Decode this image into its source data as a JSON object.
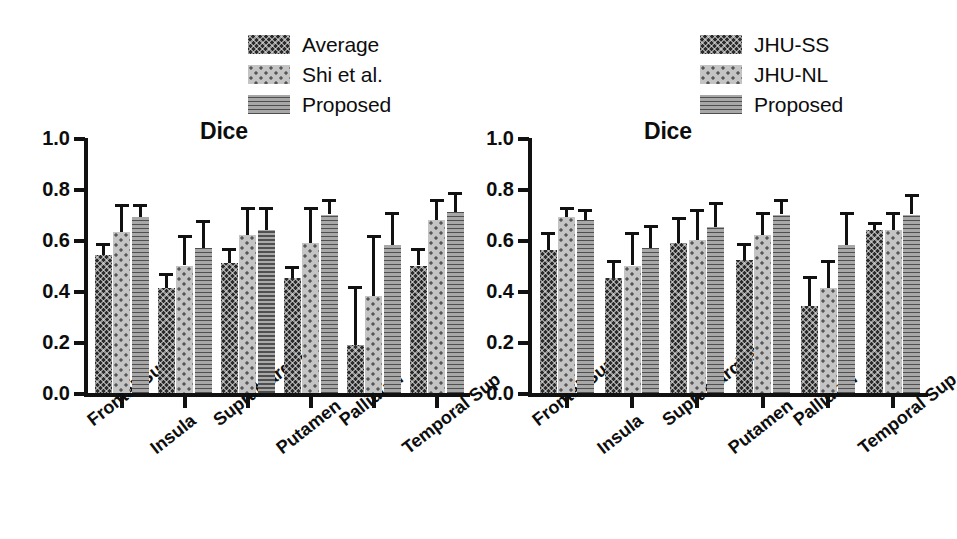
{
  "figure": {
    "panel_count": 2,
    "background": "#ffffff"
  },
  "panels": [
    {
      "id": "left-panel",
      "title": "Dice",
      "legend": [
        {
          "label": "Average",
          "pattern": "dark-crosshatch",
          "color": "#2b2b2b"
        },
        {
          "label": "Shi et al.",
          "pattern": "light-dots",
          "color": "#c4c4c4"
        },
        {
          "label": "Proposed",
          "pattern": "mid-hlines",
          "color": "#a8a8a8"
        }
      ],
      "chart_data": {
        "type": "bar",
        "title": "Dice",
        "xlabel": "",
        "ylabel": "",
        "ylim": [
          0.0,
          1.0
        ],
        "yticks": [
          "0.0",
          "0.2",
          "0.4",
          "0.6",
          "0.8",
          "1.0"
        ],
        "grid": false,
        "legend_position": "top-right",
        "categories": [
          "Frontal Sup",
          "Insula",
          "SupraMarginal",
          "Putamen",
          "Pallidum",
          "Temporal Sup"
        ],
        "series": [
          {
            "name": "Average",
            "values": [
              0.54,
              0.41,
              0.51,
              0.45,
              0.19,
              0.5
            ],
            "errors": [
              0.05,
              0.06,
              0.06,
              0.05,
              0.23,
              0.07
            ]
          },
          {
            "name": "Shi et al.",
            "values": [
              0.63,
              0.5,
              0.62,
              0.59,
              0.38,
              0.68
            ],
            "errors": [
              0.11,
              0.12,
              0.11,
              0.14,
              0.24,
              0.08
            ]
          },
          {
            "name": "Proposed",
            "values": [
              0.69,
              0.57,
              0.64,
              0.7,
              0.58,
              0.71
            ],
            "errors": [
              0.05,
              0.11,
              0.09,
              0.06,
              0.13,
              0.08
            ]
          }
        ]
      }
    },
    {
      "id": "right-panel",
      "title": "Dice",
      "legend": [
        {
          "label": "JHU-SS",
          "pattern": "dark-crosshatch",
          "color": "#2b2b2b"
        },
        {
          "label": "JHU-NL",
          "pattern": "light-dots",
          "color": "#c4c4c4"
        },
        {
          "label": "Proposed",
          "pattern": "mid-hlines",
          "color": "#a8a8a8"
        }
      ],
      "chart_data": {
        "type": "bar",
        "title": "Dice",
        "xlabel": "",
        "ylabel": "",
        "ylim": [
          0.0,
          1.0
        ],
        "yticks": [
          "0.0",
          "0.2",
          "0.4",
          "0.6",
          "0.8",
          "1.0"
        ],
        "grid": false,
        "legend_position": "top-right",
        "categories": [
          "Frontal Sup",
          "Insula",
          "SupraMarginal",
          "Putamen",
          "Pallidum",
          "Temporal Sup"
        ],
        "series": [
          {
            "name": "JHU-SS",
            "values": [
              0.56,
              0.45,
              0.59,
              0.52,
              0.34,
              0.64
            ],
            "errors": [
              0.07,
              0.07,
              0.1,
              0.07,
              0.12,
              0.03
            ]
          },
          {
            "name": "JHU-NL",
            "values": [
              0.69,
              0.5,
              0.6,
              0.62,
              0.41,
              0.64
            ],
            "errors": [
              0.04,
              0.13,
              0.12,
              0.09,
              0.11,
              0.07
            ]
          },
          {
            "name": "Proposed",
            "values": [
              0.68,
              0.57,
              0.65,
              0.7,
              0.58,
              0.7
            ],
            "errors": [
              0.04,
              0.09,
              0.1,
              0.06,
              0.13,
              0.08
            ]
          }
        ]
      }
    }
  ]
}
